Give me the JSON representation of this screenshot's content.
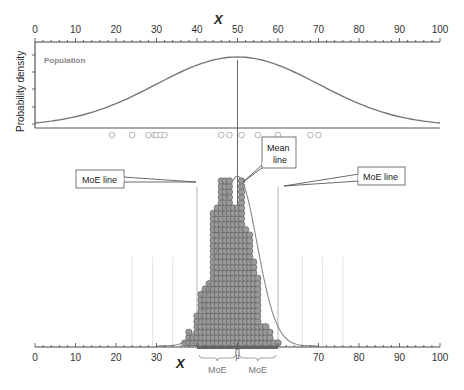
{
  "chart_data": {
    "type": "scatter",
    "title": "",
    "top_axis": {
      "label": "X",
      "ticks": [
        0,
        10,
        20,
        30,
        40,
        50,
        60,
        70,
        80,
        90,
        100
      ],
      "range": [
        0,
        100
      ]
    },
    "bottom_axis": {
      "label": "X",
      "ticks": [
        0,
        10,
        20,
        30,
        40,
        50,
        60,
        70,
        80,
        90,
        100
      ],
      "visible_tick_labels": [
        "0",
        "10",
        "20",
        "30",
        "70",
        "80",
        "90",
        "100"
      ],
      "range": [
        0,
        100
      ]
    },
    "ylabel": "Probability density",
    "population_label": "Population",
    "population_curve": {
      "type": "normal",
      "mean": 50,
      "sd": 20
    },
    "sample_points": [
      19,
      24,
      28,
      29.5,
      30,
      31,
      32,
      46,
      48,
      51,
      55,
      60,
      68,
      70
    ],
    "mean_line": {
      "x": 50,
      "label": "Mean line"
    },
    "moe_lines": [
      {
        "x": 40,
        "label": "MoE line"
      },
      {
        "x": 60,
        "label": "MoE line"
      }
    ],
    "faint_gridlines_x": [
      24,
      29,
      34,
      66,
      71,
      76
    ],
    "dot_stack_histogram": {
      "description": "Dance of the means - stacked dots of sample means",
      "bins": [
        {
          "x": 37,
          "count": 1
        },
        {
          "x": 38,
          "count": 3
        },
        {
          "x": 39,
          "count": 2
        },
        {
          "x": 40,
          "count": 6
        },
        {
          "x": 41,
          "count": 10
        },
        {
          "x": 42,
          "count": 11
        },
        {
          "x": 43,
          "count": 12
        },
        {
          "x": 44,
          "count": 25
        },
        {
          "x": 45,
          "count": 26
        },
        {
          "x": 46,
          "count": 31
        },
        {
          "x": 47,
          "count": 31
        },
        {
          "x": 48,
          "count": 31
        },
        {
          "x": 49,
          "count": 26
        },
        {
          "x": 50,
          "count": 26
        },
        {
          "x": 51,
          "count": 31
        },
        {
          "x": 52,
          "count": 22
        },
        {
          "x": 53,
          "count": 21
        },
        {
          "x": 54,
          "count": 16
        },
        {
          "x": 55,
          "count": 13
        },
        {
          "x": 56,
          "count": 4
        },
        {
          "x": 57,
          "count": 4
        },
        {
          "x": 58,
          "count": 3
        },
        {
          "x": 59,
          "count": 1
        },
        {
          "x": 60,
          "count": 1
        }
      ]
    },
    "mu_marker": {
      "x": 50,
      "label": "μ"
    },
    "moe_brackets": [
      {
        "from": 40,
        "to": 50,
        "label": "MoE"
      },
      {
        "from": 50,
        "to": 60,
        "label": "MoE"
      }
    ],
    "colors": {
      "curve": "#777777",
      "dot_fill": "#9a9a9a",
      "dot_stroke": "#555555",
      "open_circle": "#aaaaaa",
      "gridline": "#dddddd",
      "axis": "#333333",
      "moe_text": "#777777"
    }
  }
}
